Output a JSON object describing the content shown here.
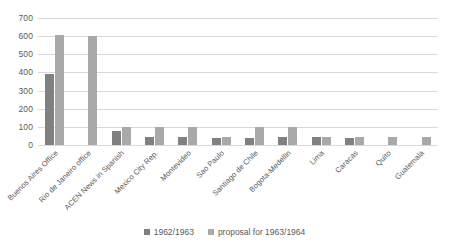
{
  "chart_data": {
    "type": "bar",
    "title": "",
    "subtitle": "",
    "xlabel": "",
    "ylabel": "",
    "ylim": [
      0,
      700
    ],
    "yticks": [
      0,
      100,
      200,
      300,
      400,
      500,
      600,
      700
    ],
    "ytick_labels": [
      "0",
      "100",
      "200",
      "300",
      "400",
      "500",
      "600",
      "700"
    ],
    "grid": "horizontal",
    "legend_position": "bottom-center",
    "categories": [
      "Buenos Aires Office",
      "Rio de Janeiro office",
      "ACEN News in Spanish",
      "Mexico City Rep.",
      "Montevideo",
      "Sao Paulo",
      "Santiago de Chile",
      "Bogota-Medellin",
      "Lima",
      "Caracas",
      "Quito",
      "Guatemala"
    ],
    "series": [
      {
        "name": "1962/1963",
        "color": "#808080",
        "values": [
          390,
          0,
          80,
          45,
          45,
          40,
          40,
          42,
          42,
          40,
          0,
          0
        ]
      },
      {
        "name": "proposal for 1963/1964",
        "color": "#a9a9a9",
        "values": [
          605,
          600,
          100,
          100,
          100,
          45,
          100,
          98,
          45,
          42,
          42,
          42
        ]
      }
    ]
  },
  "legend": {
    "entries": [
      {
        "label": "1962/1963",
        "color": "#808080"
      },
      {
        "label": "proposal for 1963/1964",
        "color": "#a9a9a9"
      }
    ]
  },
  "colors": {
    "series_1962_1963": "#808080",
    "series_proposal": "#a9a9a9",
    "gridline": "#d9d9d9",
    "text": "#5a5a5a",
    "background": "#ffffff"
  }
}
